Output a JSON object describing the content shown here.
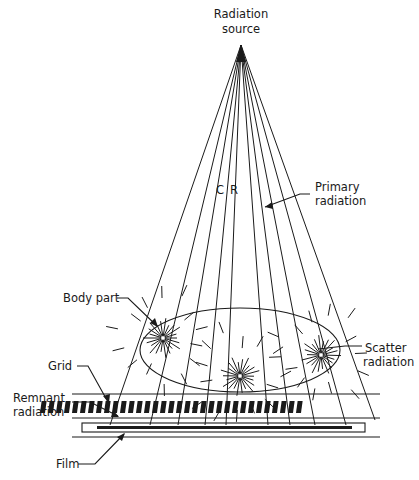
{
  "diagram": {
    "labels": {
      "source_line1": "Radiation",
      "source_line2": "source",
      "central_ray_c": "C",
      "central_ray_r": "R",
      "primary_line1": "Primary",
      "primary_line2": "radiation",
      "body_part": "Body part",
      "scatter_line1": "Scatter",
      "scatter_line2": "radiation",
      "grid": "Grid",
      "remnant_line1": "Remnant",
      "remnant_line2": "radiation",
      "film": "Film"
    },
    "colors": {
      "ink": "#1a1a1a",
      "background": "#ffffff"
    },
    "source_point": [
      241,
      45
    ],
    "ray_end_x": [
      143,
      178,
      206,
      226,
      241,
      265,
      286,
      311,
      342,
      372
    ],
    "ray_end_y": 425,
    "scatter_centers": [
      [
        163,
        338
      ],
      [
        240,
        376
      ],
      [
        321,
        355
      ]
    ]
  }
}
